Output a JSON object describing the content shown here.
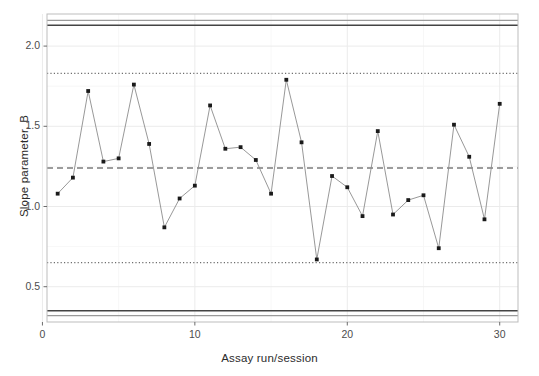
{
  "chart_data": {
    "type": "line",
    "title": "",
    "subtitle": "",
    "xlabel": "Assay run/session",
    "ylabel": "Slope parameter, B",
    "xlim": [
      0.3,
      31.2
    ],
    "ylim": [
      0.28,
      2.2
    ],
    "xticks": [
      0,
      10,
      20,
      30
    ],
    "xticklabels": [
      "0",
      "10",
      "20",
      "30"
    ],
    "yticks": [
      0.5,
      1.0,
      1.5,
      2.0
    ],
    "yticklabels": [
      "0.5",
      "1.0",
      "1.5",
      "2.0"
    ],
    "grid": true,
    "legend": "none",
    "marker": "filled-square",
    "x": [
      1,
      2,
      3,
      4,
      5,
      6,
      7,
      8,
      9,
      10,
      11,
      12,
      13,
      14,
      15,
      16,
      17,
      18,
      19,
      20,
      21,
      22,
      23,
      24,
      25,
      26,
      27,
      28,
      29,
      30
    ],
    "values": [
      1.08,
      1.18,
      1.72,
      1.28,
      1.3,
      1.76,
      1.39,
      0.87,
      1.05,
      1.13,
      1.63,
      1.36,
      1.37,
      1.29,
      1.08,
      1.79,
      1.4,
      0.67,
      1.19,
      1.12,
      0.94,
      1.47,
      0.95,
      1.04,
      1.07,
      0.74,
      1.51,
      1.31,
      0.92,
      1.64
    ],
    "series": [
      {
        "name": "Slope parameter, B",
        "values": [
          1.08,
          1.18,
          1.72,
          1.28,
          1.3,
          1.76,
          1.39,
          0.87,
          1.05,
          1.13,
          1.63,
          1.36,
          1.37,
          1.29,
          1.08,
          1.79,
          1.4,
          0.67,
          1.19,
          1.12,
          0.94,
          1.47,
          0.95,
          1.04,
          1.07,
          0.74,
          1.51,
          1.31,
          0.92,
          1.64
        ]
      }
    ],
    "reference_lines": [
      {
        "name": "center-line",
        "value": 1.24,
        "style": "dashed",
        "color": "#3a3a3a"
      },
      {
        "name": "upper-warning-limit",
        "value": 1.83,
        "style": "dotted",
        "color": "#6e6e6e"
      },
      {
        "name": "lower-warning-limit",
        "value": 0.65,
        "style": "dotted",
        "color": "#6e6e6e"
      },
      {
        "name": "upper-spec-limit",
        "value": 2.13,
        "style": "solid",
        "color": "#444444"
      },
      {
        "name": "lower-spec-limit",
        "value": 0.35,
        "style": "solid",
        "color": "#444444"
      },
      {
        "name": "upper-outer-limit",
        "value": 2.16,
        "style": "solid",
        "color": "#9a9a9a"
      },
      {
        "name": "lower-outer-limit",
        "value": 0.32,
        "style": "solid",
        "color": "#9a9a9a"
      }
    ],
    "colors": {
      "line": "#8c8c8c",
      "marker": "#1a1a1a",
      "panel_border": "#bdbdbd",
      "grid_major": "#ebebeb",
      "grid_minor": "#f5f5f5",
      "background": "#ffffff",
      "text": "#4d4d4d"
    }
  }
}
